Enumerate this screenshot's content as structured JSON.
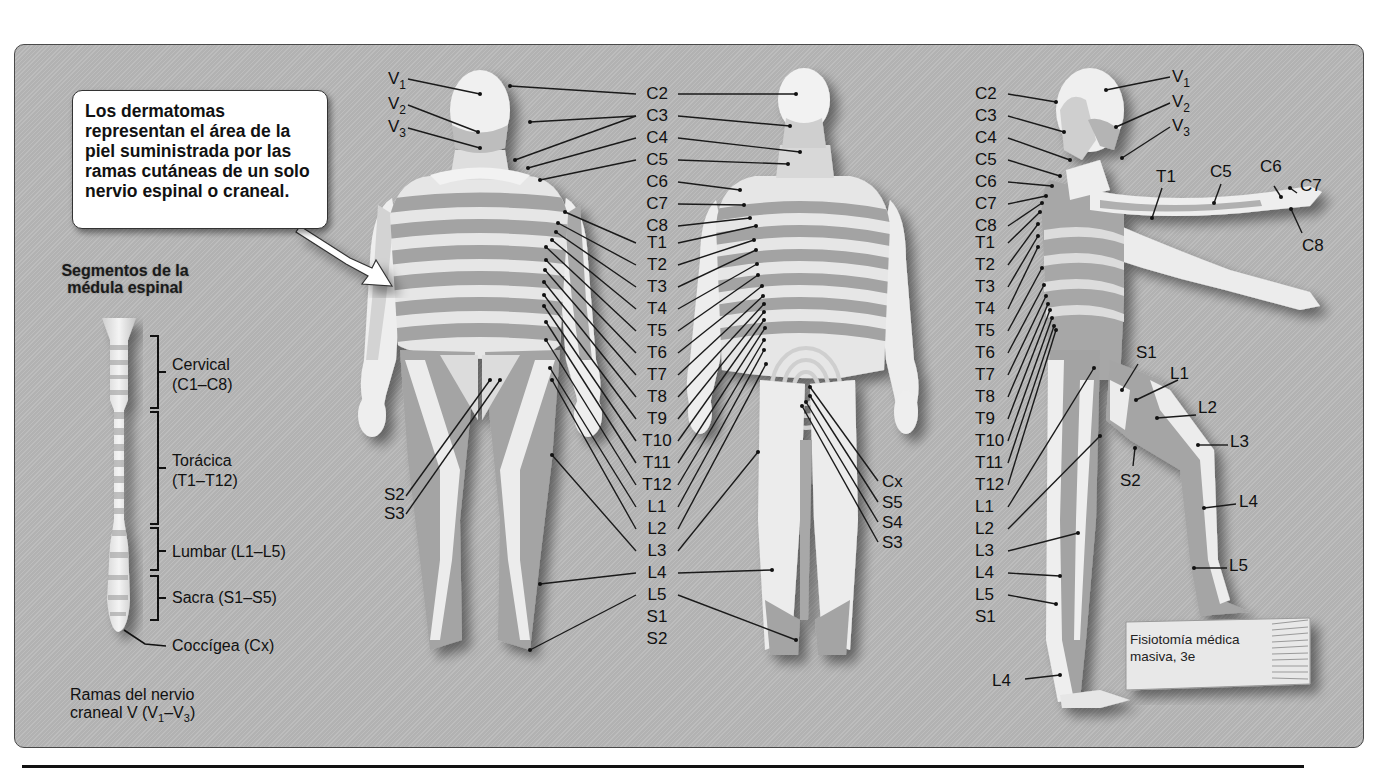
{
  "callout": {
    "text": "Los dermatomas representan el área de la piel suministrada por las ramas cutáneas de un solo nervio espinal o craneal."
  },
  "spinal_cord": {
    "title_line1": "Segmentos de la",
    "title_line2": "médula espinal",
    "regions": [
      {
        "name": "Cervical",
        "range": "(C1–C8)"
      },
      {
        "name": "Torácica",
        "range": "(T1–T12)"
      },
      {
        "name": "Lumbar (L1–L5)",
        "range": ""
      },
      {
        "name": "Sacra (S1–S5)",
        "range": ""
      },
      {
        "name": "Coccígea (Cx)",
        "range": ""
      }
    ]
  },
  "cranial_note": {
    "line1": "Ramas del nervio",
    "line2_prefix": "craneal V (V",
    "sub1": "1",
    "dash": "–V",
    "sub3": "3",
    "close": ")"
  },
  "anterior_view": {
    "trigeminal_labels": [
      {
        "base": "V",
        "sub": "1"
      },
      {
        "base": "V",
        "sub": "2"
      },
      {
        "base": "V",
        "sub": "3"
      }
    ],
    "sacral_labels": [
      "S2",
      "S3"
    ]
  },
  "central_labels": [
    "C2",
    "C3",
    "C4",
    "C5",
    "C6",
    "C7",
    "C8",
    "T1",
    "T2",
    "T3",
    "T4",
    "T5",
    "T6",
    "T7",
    "T8",
    "T9",
    "T10",
    "T11",
    "T12",
    "L1",
    "L2",
    "L3",
    "L4",
    "L5",
    "S1",
    "S2"
  ],
  "posterior_view": {
    "sacral_labels": [
      "Cx",
      "S5",
      "S4",
      "S3"
    ]
  },
  "lateral_view": {
    "left_column": [
      "C2",
      "C3",
      "C4",
      "C5",
      "C6",
      "C7",
      "C8",
      "T1",
      "T2",
      "T3",
      "T4",
      "T5",
      "T6",
      "T7",
      "T8",
      "T9",
      "T10",
      "T11",
      "T12",
      "L1",
      "L2",
      "L3",
      "L4",
      "L5",
      "S1"
    ],
    "trigeminal_labels": [
      {
        "base": "V",
        "sub": "1"
      },
      {
        "base": "V",
        "sub": "2"
      },
      {
        "base": "V",
        "sub": "3"
      }
    ],
    "arm_labels": [
      "T1",
      "C5",
      "C6",
      "C7",
      "C8"
    ],
    "leg_labels": [
      "S1",
      "L1",
      "L2",
      "L3",
      "S2",
      "L4",
      "L5"
    ],
    "foot_label": "L4"
  },
  "book": {
    "line1": "Fisiotomía médica",
    "line2": "masiva, 3e"
  },
  "colors": {
    "background": "#b9b9b9",
    "skin_light": "#eeeeee",
    "skin_mid": "#a8a8a8",
    "skin_dark": "#8f8f8f",
    "callout_bg": "#ffffff",
    "text": "#111111"
  }
}
